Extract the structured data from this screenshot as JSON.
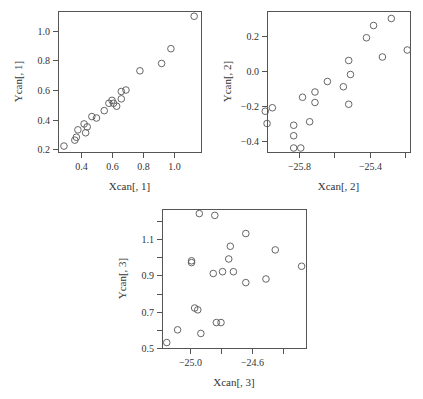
{
  "chart_data": [
    {
      "type": "scatter",
      "title": "",
      "xlabel": "Xcan[, 1]",
      "ylabel": "Ycan[, 1]",
      "frame": {
        "left": 58,
        "top": 11,
        "right": 201,
        "bottom": 152
      },
      "xmap": {
        "v0": 0.4,
        "p0": 81,
        "v1": 1.0,
        "p1": 174
      },
      "ymap": {
        "v0": 0.2,
        "p0": 149,
        "v1": 1.0,
        "p1": 31
      },
      "xticks": [
        0.4,
        0.6,
        0.8,
        1.0
      ],
      "xtick_labels": [
        "0.4",
        "0.6",
        "0.8",
        "1.0"
      ],
      "yticks": [
        0.2,
        0.4,
        0.6,
        0.8,
        1.0
      ],
      "ytick_labels": [
        "0.2",
        "0.4",
        "0.6",
        "0.8",
        "1.0"
      ],
      "grid": false,
      "marker": "open-circle",
      "points": [
        {
          "x": 0.29,
          "y": 0.22
        },
        {
          "x": 0.36,
          "y": 0.26
        },
        {
          "x": 0.37,
          "y": 0.28
        },
        {
          "x": 0.38,
          "y": 0.33
        },
        {
          "x": 0.42,
          "y": 0.37
        },
        {
          "x": 0.43,
          "y": 0.31
        },
        {
          "x": 0.44,
          "y": 0.35
        },
        {
          "x": 0.47,
          "y": 0.42
        },
        {
          "x": 0.5,
          "y": 0.41
        },
        {
          "x": 0.55,
          "y": 0.46
        },
        {
          "x": 0.58,
          "y": 0.51
        },
        {
          "x": 0.6,
          "y": 0.53
        },
        {
          "x": 0.61,
          "y": 0.51
        },
        {
          "x": 0.63,
          "y": 0.49
        },
        {
          "x": 0.66,
          "y": 0.54
        },
        {
          "x": 0.66,
          "y": 0.59
        },
        {
          "x": 0.69,
          "y": 0.6
        },
        {
          "x": 0.78,
          "y": 0.73
        },
        {
          "x": 0.92,
          "y": 0.78
        },
        {
          "x": 0.98,
          "y": 0.88
        },
        {
          "x": 1.13,
          "y": 1.1
        }
      ]
    },
    {
      "type": "scatter",
      "title": "",
      "xlabel": "Xcan[, 2]",
      "ylabel": "Ycan[, 2]",
      "frame": {
        "left": 267,
        "top": 11,
        "right": 410,
        "bottom": 152
      },
      "xmap": {
        "v0": -25.8,
        "p0": 299,
        "v1": -25.4,
        "p1": 370
      },
      "ymap": {
        "v0": -0.4,
        "p0": 141,
        "v1": 0.2,
        "p1": 36
      },
      "xticks": [
        -25.8,
        -25.6,
        -25.4,
        -25.2
      ],
      "xtick_labels": [
        "-25.8",
        "",
        "-25.4",
        ""
      ],
      "yticks": [
        -0.4,
        -0.2,
        0.0,
        0.2
      ],
      "ytick_labels": [
        "-0.4",
        "-0.2",
        "0.0",
        "0.2"
      ],
      "grid": false,
      "marker": "open-circle",
      "points": [
        {
          "x": -25.99,
          "y": -0.23
        },
        {
          "x": -25.98,
          "y": -0.3
        },
        {
          "x": -25.95,
          "y": -0.21
        },
        {
          "x": -25.83,
          "y": -0.31
        },
        {
          "x": -25.83,
          "y": -0.37
        },
        {
          "x": -25.83,
          "y": -0.44
        },
        {
          "x": -25.79,
          "y": -0.44
        },
        {
          "x": -25.78,
          "y": -0.15
        },
        {
          "x": -25.74,
          "y": -0.29
        },
        {
          "x": -25.71,
          "y": -0.18
        },
        {
          "x": -25.71,
          "y": -0.12
        },
        {
          "x": -25.64,
          "y": -0.06
        },
        {
          "x": -25.55,
          "y": -0.09
        },
        {
          "x": -25.52,
          "y": 0.06
        },
        {
          "x": -25.51,
          "y": -0.02
        },
        {
          "x": -25.52,
          "y": -0.19
        },
        {
          "x": -25.42,
          "y": 0.19
        },
        {
          "x": -25.38,
          "y": 0.26
        },
        {
          "x": -25.33,
          "y": 0.08
        },
        {
          "x": -25.28,
          "y": 0.3
        },
        {
          "x": -25.19,
          "y": 0.12
        }
      ]
    },
    {
      "type": "scatter",
      "title": "",
      "xlabel": "Xcan[, 3]",
      "ylabel": "Ycan[, 3]",
      "frame": {
        "left": 162,
        "top": 209,
        "right": 306,
        "bottom": 348
      },
      "xmap": {
        "v0": -25.0,
        "p0": 190,
        "v1": -24.6,
        "p1": 252
      },
      "ymap": {
        "v0": 0.5,
        "p0": 348,
        "v1": 1.1,
        "p1": 239
      },
      "xticks": [
        -25.0,
        -24.8,
        -24.6,
        -24.4
      ],
      "xtick_labels": [
        "-25.0",
        "",
        "-24.6",
        ""
      ],
      "yticks": [
        0.5,
        0.6,
        0.7,
        0.8,
        0.9,
        1.0,
        1.1,
        1.2
      ],
      "ytick_labels": [
        "0.5",
        "",
        "0.7",
        "",
        "0.9",
        "",
        "1.1",
        ""
      ],
      "grid": false,
      "marker": "open-circle",
      "points": [
        {
          "x": -25.15,
          "y": 0.53
        },
        {
          "x": -25.08,
          "y": 0.6
        },
        {
          "x": -24.99,
          "y": 0.98
        },
        {
          "x": -24.99,
          "y": 0.97
        },
        {
          "x": -24.97,
          "y": 0.72
        },
        {
          "x": -24.95,
          "y": 0.71
        },
        {
          "x": -24.94,
          "y": 1.24
        },
        {
          "x": -24.93,
          "y": 0.58
        },
        {
          "x": -24.85,
          "y": 0.91
        },
        {
          "x": -24.84,
          "y": 1.23
        },
        {
          "x": -24.83,
          "y": 0.64
        },
        {
          "x": -24.8,
          "y": 0.64
        },
        {
          "x": -24.79,
          "y": 0.92
        },
        {
          "x": -24.75,
          "y": 0.99
        },
        {
          "x": -24.74,
          "y": 1.06
        },
        {
          "x": -24.72,
          "y": 0.92
        },
        {
          "x": -24.64,
          "y": 1.13
        },
        {
          "x": -24.64,
          "y": 0.86
        },
        {
          "x": -24.51,
          "y": 0.88
        },
        {
          "x": -24.45,
          "y": 1.04
        },
        {
          "x": -24.28,
          "y": 0.95
        }
      ]
    }
  ]
}
